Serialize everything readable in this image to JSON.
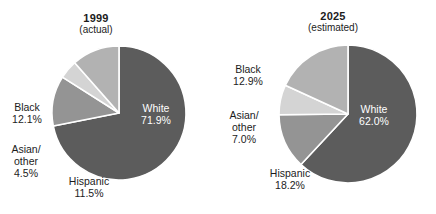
{
  "figure": {
    "background_color": "#ffffff",
    "text_color": "#1c1c1c",
    "inside_label_color": "#ffffff",
    "separator_color": "#ffffff"
  },
  "chart_data": [
    {
      "type": "pie",
      "id": "1999",
      "title": "1999",
      "subtitle": "(actual)",
      "categories": [
        "White",
        "Black",
        "Asian/other",
        "Hispanic"
      ],
      "values": [
        71.9,
        12.1,
        4.5,
        11.5
      ],
      "value_labels": [
        "71.9%",
        "12.1%",
        "4.5%",
        "11.5%"
      ],
      "colors": [
        "#5c5c5c",
        "#949494",
        "#d4d4d4",
        "#b2b2b2"
      ],
      "start_angle_deg": 0,
      "direction": "clockwise",
      "center": [
        119,
        113
      ],
      "radius": 67,
      "legend": "none",
      "grid": false,
      "labels": [
        {
          "name": "White",
          "name2": "",
          "value": "71.9%",
          "placement": "inside"
        },
        {
          "name": "Black",
          "name2": "",
          "value": "12.1%",
          "placement": "outside"
        },
        {
          "name": "Asian/",
          "name2": "other",
          "value": "4.5%",
          "placement": "outside"
        },
        {
          "name": "Hispanic",
          "name2": "",
          "value": "11.5%",
          "placement": "outside"
        }
      ]
    },
    {
      "type": "pie",
      "id": "2025",
      "title": "2025",
      "subtitle": "(estimated)",
      "categories": [
        "White",
        "Black",
        "Asian/other",
        "Hispanic"
      ],
      "values": [
        62.0,
        12.9,
        7.0,
        18.2
      ],
      "value_labels": [
        "62.0%",
        "12.9%",
        "7.0%",
        "18.2%"
      ],
      "colors": [
        "#5c5c5c",
        "#949494",
        "#d4d4d4",
        "#b2b2b2"
      ],
      "start_angle_deg": 0,
      "direction": "clockwise",
      "center": [
        130,
        114
      ],
      "radius": 69,
      "legend": "none",
      "grid": false,
      "labels": [
        {
          "name": "White",
          "name2": "",
          "value": "62.0%",
          "placement": "inside"
        },
        {
          "name": "Black",
          "name2": "",
          "value": "12.9%",
          "placement": "outside"
        },
        {
          "name": "Asian/",
          "name2": "other",
          "value": "7.0%",
          "placement": "outside"
        },
        {
          "name": "Hispanic",
          "name2": "",
          "value": "18.2%",
          "placement": "outside"
        }
      ]
    }
  ]
}
